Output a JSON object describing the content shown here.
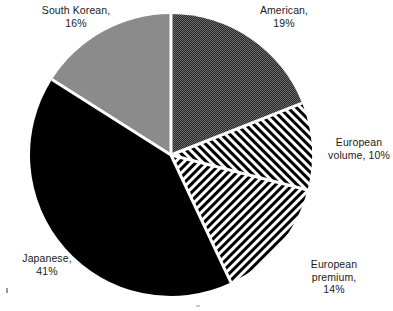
{
  "chart_data": {
    "type": "pie",
    "title": "",
    "subtitle": "",
    "xlabel": "",
    "ylabel": "",
    "legend_position": "none",
    "grid": false,
    "units": "percent",
    "start_angle_deg": 0,
    "direction": "clockwise",
    "total": 100,
    "categories": [
      "American",
      "European volume",
      "European premium",
      "Japanese",
      "South Korean"
    ],
    "values": [
      19,
      10,
      14,
      41,
      16
    ],
    "slices": [
      {
        "name": "American",
        "value": 19,
        "label_text": "American,\n19%",
        "label_line1": "American,",
        "label_line2": "19%",
        "fill_style": "checkerboard-dither",
        "fill_color": "#3a3a3a",
        "start_deg": 0,
        "end_deg": 68.4
      },
      {
        "name": "European volume",
        "value": 10,
        "label_text": "European\nvolume, 10%",
        "label_line1": "European",
        "label_line2": "volume, 10%",
        "fill_style": "diagonal-hatch-forward",
        "fill_color": "#000000",
        "start_deg": 68.4,
        "end_deg": 104.4
      },
      {
        "name": "European premium",
        "value": 14,
        "label_text": "European\npremium,\n14%",
        "label_line1": "European",
        "label_line2": "premium,",
        "label_line3": "14%",
        "fill_style": "diagonal-hatch-back",
        "fill_color": "#000000",
        "start_deg": 104.4,
        "end_deg": 154.8
      },
      {
        "name": "Japanese",
        "value": 41,
        "label_text": "Japanese,\n41%",
        "label_line1": "Japanese,",
        "label_line2": "41%",
        "fill_style": "solid",
        "fill_color": "#000000",
        "start_deg": 154.8,
        "end_deg": 302.4
      },
      {
        "name": "South Korean",
        "value": 16,
        "label_text": "South Korean,\n16%",
        "label_line1": "South Korean,",
        "label_line2": "16%",
        "fill_style": "solid",
        "fill_color": "#8b8b8b",
        "start_deg": 302.4,
        "end_deg": 360
      }
    ],
    "geometry": {
      "center_x": 171,
      "center_y": 155,
      "radius": 141,
      "separator_color": "#ffffff",
      "separator_width": 3
    },
    "background_color": "#ffffff"
  }
}
